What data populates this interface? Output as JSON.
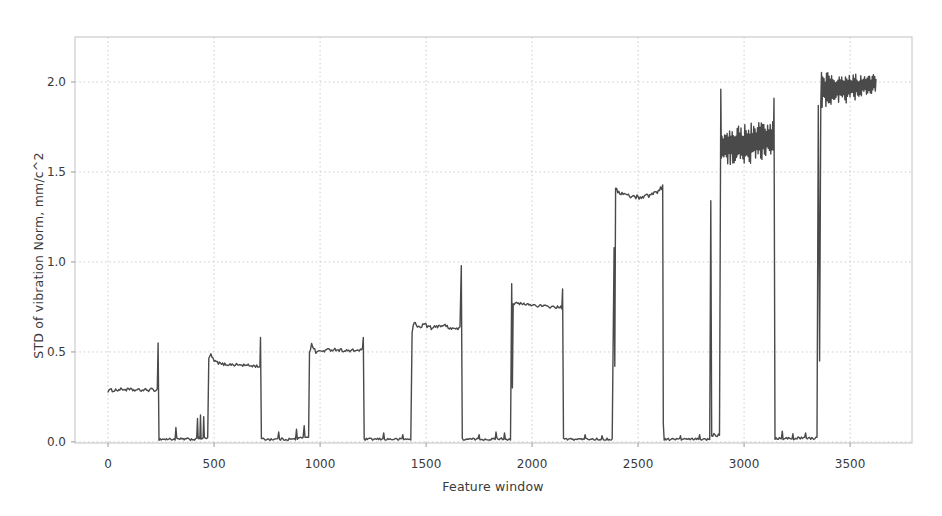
{
  "figure": {
    "background": "#ffffff"
  },
  "chart_data": {
    "type": "line",
    "title": "",
    "xlabel": "Feature window",
    "ylabel": "STD of vibration Norm, mm/c^2",
    "x_tick_labels": [
      "0",
      "500",
      "1000",
      "1500",
      "2000",
      "2500",
      "3000",
      "3500"
    ],
    "x_tick_values": [
      0,
      500,
      1000,
      1500,
      2000,
      2500,
      3000,
      3500
    ],
    "y_tick_labels": [
      "0.0",
      "0.5",
      "1.0",
      "1.5",
      "2.0"
    ],
    "y_tick_values": [
      0,
      0.5,
      1.0,
      1.5,
      2.0
    ],
    "xlim": [
      -156,
      3792
    ],
    "ylim": [
      -0.006,
      2.25
    ],
    "grid": true,
    "grid_style": "dotted",
    "legend": "none",
    "line_color": "#4a4a4a",
    "grid_color": "#cbcbcb",
    "spine_color": "#c2c2c2",
    "axis_text_color": "#3a3a3a",
    "segments": [
      {
        "kind": "noisy",
        "x0": 0,
        "x1": 232,
        "amp": 0.009,
        "profile": [
          [
            0,
            0.285
          ],
          [
            0.3,
            0.292
          ],
          [
            0.6,
            0.287
          ],
          [
            1,
            0.29
          ]
        ]
      },
      {
        "kind": "spike",
        "x": 236,
        "v": 0.55
      },
      {
        "kind": "noisy",
        "x0": 240,
        "x1": 316,
        "amp": 0.007,
        "mean": 0.015
      },
      {
        "kind": "spike",
        "x": 320,
        "v": 0.08
      },
      {
        "kind": "noisy",
        "x0": 324,
        "x1": 418,
        "amp": 0.007,
        "mean": 0.015
      },
      {
        "kind": "spike",
        "x": 422,
        "v": 0.13
      },
      {
        "kind": "noisy",
        "x0": 425,
        "x1": 433,
        "amp": 0.006,
        "mean": 0.02
      },
      {
        "kind": "spike",
        "x": 436,
        "v": 0.15
      },
      {
        "kind": "noisy",
        "x0": 439,
        "x1": 448,
        "amp": 0.006,
        "mean": 0.02
      },
      {
        "kind": "spike",
        "x": 451,
        "v": 0.14
      },
      {
        "kind": "noisy",
        "x0": 454,
        "x1": 470,
        "amp": 0.007,
        "mean": 0.02
      },
      {
        "kind": "noisy",
        "x0": 475,
        "x1": 716,
        "amp": 0.008,
        "profile": [
          [
            0,
            0.46
          ],
          [
            0.03,
            0.49
          ],
          [
            0.1,
            0.45
          ],
          [
            0.25,
            0.432
          ],
          [
            0.6,
            0.428
          ],
          [
            1,
            0.42
          ]
        ]
      },
      {
        "kind": "spike",
        "x": 719,
        "v": 0.58
      },
      {
        "kind": "noisy",
        "x0": 723,
        "x1": 800,
        "amp": 0.007,
        "mean": 0.015
      },
      {
        "kind": "spike",
        "x": 805,
        "v": 0.055
      },
      {
        "kind": "noisy",
        "x0": 809,
        "x1": 884,
        "amp": 0.007,
        "mean": 0.015
      },
      {
        "kind": "spike",
        "x": 889,
        "v": 0.07
      },
      {
        "kind": "noisy",
        "x0": 893,
        "x1": 920,
        "amp": 0.008,
        "mean": 0.02
      },
      {
        "kind": "spike",
        "x": 925,
        "v": 0.09
      },
      {
        "kind": "noisy",
        "x0": 929,
        "x1": 946,
        "amp": 0.008,
        "mean": 0.03
      },
      {
        "kind": "noisy",
        "x0": 950,
        "x1": 1200,
        "amp": 0.009,
        "profile": [
          [
            0,
            0.5
          ],
          [
            0.04,
            0.54
          ],
          [
            0.12,
            0.5
          ],
          [
            0.45,
            0.515
          ],
          [
            0.75,
            0.505
          ],
          [
            1,
            0.512
          ]
        ]
      },
      {
        "kind": "spike",
        "x": 1204,
        "v": 0.58
      },
      {
        "kind": "noisy",
        "x0": 1208,
        "x1": 1296,
        "amp": 0.006,
        "mean": 0.015
      },
      {
        "kind": "spike",
        "x": 1300,
        "v": 0.05
      },
      {
        "kind": "noisy",
        "x0": 1304,
        "x1": 1386,
        "amp": 0.006,
        "mean": 0.015
      },
      {
        "kind": "spike",
        "x": 1390,
        "v": 0.04
      },
      {
        "kind": "noisy",
        "x0": 1394,
        "x1": 1428,
        "amp": 0.006,
        "mean": 0.015
      },
      {
        "kind": "noisy",
        "x0": 1434,
        "x1": 1660,
        "amp": 0.011,
        "profile": [
          [
            0,
            0.6
          ],
          [
            0.04,
            0.67
          ],
          [
            0.12,
            0.635
          ],
          [
            0.25,
            0.655
          ],
          [
            0.42,
            0.63
          ],
          [
            0.58,
            0.65
          ],
          [
            0.75,
            0.64
          ],
          [
            0.9,
            0.628
          ],
          [
            1,
            0.632
          ]
        ]
      },
      {
        "kind": "spike",
        "x": 1666,
        "v": 0.98
      },
      {
        "kind": "noisy",
        "x0": 1671,
        "x1": 1746,
        "amp": 0.006,
        "mean": 0.015
      },
      {
        "kind": "spike",
        "x": 1750,
        "v": 0.04
      },
      {
        "kind": "noisy",
        "x0": 1754,
        "x1": 1826,
        "amp": 0.006,
        "mean": 0.015
      },
      {
        "kind": "spike",
        "x": 1830,
        "v": 0.055
      },
      {
        "kind": "noisy",
        "x0": 1834,
        "x1": 1866,
        "amp": 0.006,
        "mean": 0.018
      },
      {
        "kind": "spike",
        "x": 1870,
        "v": 0.05
      },
      {
        "kind": "noisy",
        "x0": 1874,
        "x1": 1898,
        "amp": 0.006,
        "mean": 0.015
      },
      {
        "kind": "spike",
        "x": 1904,
        "v": 0.88
      },
      {
        "kind": "point",
        "x": 1907,
        "v": 0.3
      },
      {
        "kind": "noisy",
        "x0": 1911,
        "x1": 2140,
        "amp": 0.008,
        "profile": [
          [
            0,
            0.77
          ],
          [
            0.35,
            0.762
          ],
          [
            0.7,
            0.752
          ],
          [
            1,
            0.747
          ]
        ]
      },
      {
        "kind": "spike",
        "x": 2144,
        "v": 0.85
      },
      {
        "kind": "noisy",
        "x0": 2148,
        "x1": 2246,
        "amp": 0.006,
        "mean": 0.015
      },
      {
        "kind": "spike",
        "x": 2250,
        "v": 0.04
      },
      {
        "kind": "noisy",
        "x0": 2254,
        "x1": 2326,
        "amp": 0.006,
        "mean": 0.015
      },
      {
        "kind": "spike",
        "x": 2330,
        "v": 0.035
      },
      {
        "kind": "noisy",
        "x0": 2334,
        "x1": 2378,
        "amp": 0.006,
        "mean": 0.015
      },
      {
        "kind": "spike",
        "x": 2387,
        "v": 1.08
      },
      {
        "kind": "point",
        "x": 2390,
        "v": 0.42
      },
      {
        "kind": "noisy",
        "x0": 2394,
        "x1": 2616,
        "amp": 0.012,
        "profile": [
          [
            0,
            1.4
          ],
          [
            0.12,
            1.382
          ],
          [
            0.3,
            1.366
          ],
          [
            0.5,
            1.36
          ],
          [
            0.7,
            1.37
          ],
          [
            0.88,
            1.39
          ],
          [
            1,
            1.42
          ]
        ]
      },
      {
        "kind": "point",
        "x": 2619,
        "v": 0.1
      },
      {
        "kind": "noisy",
        "x0": 2623,
        "x1": 2696,
        "amp": 0.006,
        "mean": 0.015
      },
      {
        "kind": "spike",
        "x": 2700,
        "v": 0.035
      },
      {
        "kind": "noisy",
        "x0": 2704,
        "x1": 2786,
        "amp": 0.006,
        "mean": 0.015
      },
      {
        "kind": "spike",
        "x": 2790,
        "v": 0.04
      },
      {
        "kind": "noisy",
        "x0": 2794,
        "x1": 2838,
        "amp": 0.006,
        "mean": 0.015
      },
      {
        "kind": "spike",
        "x": 2843,
        "v": 1.34
      },
      {
        "kind": "noisy",
        "x0": 2847,
        "x1": 2884,
        "amp": 0.01,
        "mean": 0.04
      },
      {
        "kind": "spike",
        "x": 2890,
        "v": 1.96
      },
      {
        "kind": "noisy",
        "x0": 2893,
        "x1": 3138,
        "amp": 0.115,
        "step": 3,
        "profile": [
          [
            0,
            1.64
          ],
          [
            0.5,
            1.655
          ],
          [
            1,
            1.69
          ]
        ]
      },
      {
        "kind": "spike",
        "x": 3141,
        "v": 1.91
      },
      {
        "kind": "noisy",
        "x0": 3146,
        "x1": 3176,
        "amp": 0.008,
        "mean": 0.02
      },
      {
        "kind": "spike",
        "x": 3180,
        "v": 0.06
      },
      {
        "kind": "noisy",
        "x0": 3184,
        "x1": 3226,
        "amp": 0.008,
        "mean": 0.02
      },
      {
        "kind": "spike",
        "x": 3230,
        "v": 0.045
      },
      {
        "kind": "noisy",
        "x0": 3234,
        "x1": 3286,
        "amp": 0.008,
        "mean": 0.02
      },
      {
        "kind": "spike",
        "x": 3290,
        "v": 0.05
      },
      {
        "kind": "noisy",
        "x0": 3294,
        "x1": 3344,
        "amp": 0.008,
        "mean": 0.02
      },
      {
        "kind": "spike",
        "x": 3350,
        "v": 1.87
      },
      {
        "kind": "point",
        "x": 3356,
        "v": 0.45
      },
      {
        "kind": "noisy",
        "x0": 3362,
        "x1": 3622,
        "amp": 0.11,
        "amp1": 0.05,
        "step": 3,
        "profile": [
          [
            0,
            1.96
          ],
          [
            0.5,
            1.965
          ],
          [
            1,
            1.995
          ]
        ]
      }
    ]
  }
}
